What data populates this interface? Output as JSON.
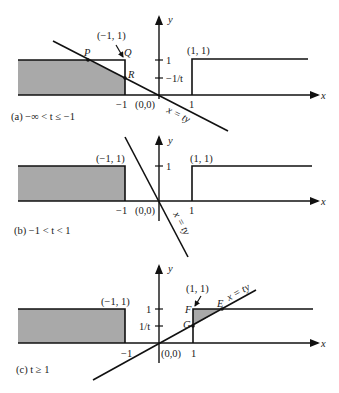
{
  "figure": {
    "panels": [
      {
        "id": "a",
        "caption": "(a) −∞ < t ≤ −1",
        "labels": {
          "y_axis": "y",
          "x_axis": "x",
          "point_neg1_1": "(−1, 1)",
          "point_1_1": "(1, 1)",
          "origin": "(0,0)",
          "tick_x_neg1": "−1",
          "tick_x_1": "1",
          "tick_y_1": "1",
          "tick_y_neg_inv_t": "−1/t",
          "line": "x = ty",
          "P": "P",
          "Q": "Q",
          "R": "R"
        }
      },
      {
        "id": "b",
        "caption": "(b) −1 < t < 1",
        "labels": {
          "y_axis": "y",
          "x_axis": "x",
          "point_neg1_1": "(−1, 1)",
          "point_1_1": "(1, 1)",
          "origin": "(0,0)",
          "tick_x_neg1": "−1",
          "tick_x_1": "1",
          "tick_y_1": "1",
          "line": "x = ty"
        }
      },
      {
        "id": "c",
        "caption": "(c) t ≥ 1",
        "labels": {
          "y_axis": "y",
          "x_axis": "x",
          "point_neg1_1": "(−1, 1)",
          "point_1_1": "(1, 1)",
          "origin": "(0,0)",
          "tick_x_neg1": "−1",
          "tick_x_1": "1",
          "tick_y_1": "1",
          "tick_y_inv_t": "1/t",
          "line": "x = ty",
          "E": "E",
          "F": "F",
          "G": "G"
        }
      }
    ],
    "colors": {
      "shade": "#a9a9a9",
      "stroke": "#111111",
      "background": "#ffffff"
    }
  }
}
